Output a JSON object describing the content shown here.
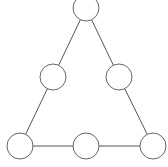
{
  "diagram": {
    "type": "triangle-node-graph",
    "stroke_color": "#666666",
    "node_fill": "#ffffff",
    "node_radius": 13,
    "nodes": [
      {
        "id": "top",
        "cx": 86,
        "cy": 8,
        "label": ""
      },
      {
        "id": "mid-left",
        "cx": 53,
        "cy": 77,
        "label": ""
      },
      {
        "id": "mid-right",
        "cx": 119,
        "cy": 77,
        "label": ""
      },
      {
        "id": "bottom-left",
        "cx": 20,
        "cy": 146,
        "label": ""
      },
      {
        "id": "bottom-middle",
        "cx": 86,
        "cy": 146,
        "label": ""
      },
      {
        "id": "bottom-right",
        "cx": 153,
        "cy": 146,
        "label": ""
      }
    ],
    "edges": [
      [
        "top",
        "mid-left"
      ],
      [
        "top",
        "mid-right"
      ],
      [
        "mid-left",
        "bottom-left"
      ],
      [
        "mid-right",
        "bottom-right"
      ],
      [
        "bottom-left",
        "bottom-middle"
      ],
      [
        "bottom-middle",
        "bottom-right"
      ]
    ]
  }
}
